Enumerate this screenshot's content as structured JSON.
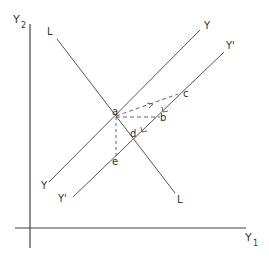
{
  "diagram": {
    "axes": {
      "y_axis_label": "Y",
      "y_axis_subscript": "2",
      "x_axis_label": "Y",
      "x_axis_subscript": "1"
    },
    "lines": {
      "Y": {
        "label_top": "Y",
        "label_bottom": "Y"
      },
      "Y_prime": {
        "label_top": "Y'",
        "label_bottom": "Y'"
      },
      "L": {
        "label_top": "L",
        "label_bottom": "L"
      }
    },
    "points": {
      "a": "a",
      "b": "b",
      "c": "c",
      "d": "d",
      "e": "e"
    },
    "colors": {
      "line": "#555555",
      "text": "#333333",
      "background": "#ffffff"
    }
  }
}
